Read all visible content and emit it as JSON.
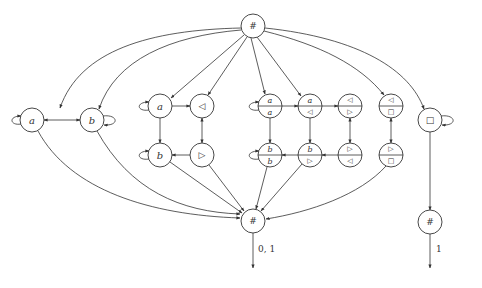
{
  "diagram": {
    "type": "automaton-graph",
    "nodes": {
      "top_hash": {
        "label": "#"
      },
      "left_a": {
        "label": "a"
      },
      "left_b": {
        "label": "b"
      },
      "g2_a": {
        "label": "a"
      },
      "g2_lt": {
        "label": "◁"
      },
      "g2_b": {
        "label": "b"
      },
      "g2_rt": {
        "label": "▷"
      },
      "s_aa": {
        "top": "a",
        "bottom": "a"
      },
      "s_alt": {
        "top": "a",
        "bottom": "◁"
      },
      "s_ltrt": {
        "top": "◁",
        "bottom": "▷"
      },
      "s_ltbox": {
        "top": "◁",
        "bottom": "□"
      },
      "s_bb": {
        "top": "b",
        "bottom": "b"
      },
      "s_brt": {
        "top": "b",
        "bottom": "▷"
      },
      "s_rtlt": {
        "top": "▷",
        "bottom": "◁"
      },
      "s_rtbox": {
        "top": "▷",
        "bottom": "□"
      },
      "box": {
        "label": "□"
      },
      "bottom_hash": {
        "label": "#"
      },
      "right_hash": {
        "label": "#"
      }
    },
    "edge_labels": {
      "bottom_out": "0, 1",
      "right_out": "1"
    }
  }
}
